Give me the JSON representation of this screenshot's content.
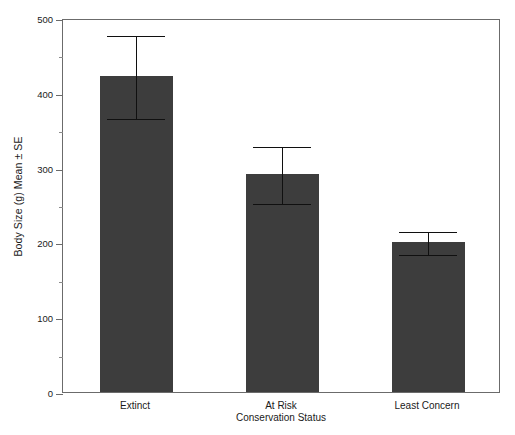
{
  "chart_data": {
    "type": "bar",
    "title": "",
    "xlabel": "Conservation Status",
    "ylabel": "Body Size (g) Mean ± SE",
    "categories": [
      "Extinct",
      "At Risk",
      "Least Concern"
    ],
    "values": [
      423,
      292,
      201
    ],
    "errors": [
      55,
      38,
      15
    ],
    "error_low": [
      368,
      254,
      186
    ],
    "error_high": [
      478,
      330,
      216
    ],
    "ylim": [
      0,
      500
    ],
    "yticks": [
      0,
      100,
      200,
      300,
      400,
      500
    ],
    "ytick_labels": [
      "0",
      "100",
      "200",
      "300",
      "400",
      "500"
    ],
    "yminor_ticks": [
      50,
      150,
      250,
      350,
      450
    ],
    "grid": false,
    "legend": null,
    "bar_color": "#3d3d3d",
    "error_color": "#101010",
    "axis_color": "#6b6b6b",
    "background": "#ffffff"
  },
  "axis": {
    "y_title": "Body Size (g) Mean ± SE",
    "x_title": "Conservation Status"
  }
}
